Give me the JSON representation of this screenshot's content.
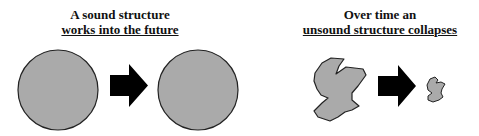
{
  "left_panel": {
    "caption_line1": "A sound structure",
    "caption_line2": "works into the future",
    "shapes": [
      "circle",
      "arrow-right",
      "circle"
    ]
  },
  "right_panel": {
    "caption_line1": "Over time an",
    "caption_line2": "unsound structure collapses",
    "shapes": [
      "irregular-blob-large",
      "arrow-right",
      "irregular-blob-small"
    ]
  },
  "colors": {
    "shape_fill": "#aaaaaa",
    "shape_stroke": "#222222",
    "arrow_fill": "#000000",
    "background": "#ffffff"
  }
}
